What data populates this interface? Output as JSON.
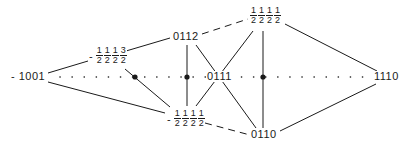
{
  "diagram": {
    "colors": {
      "ink": "#1a1a1a",
      "background": "#ffffff"
    },
    "axis": {
      "style": "dotted",
      "y": 77,
      "x_start": 40,
      "x_end": 378
    },
    "nodes": {
      "n1001": {
        "text": "- 1001",
        "x": 12,
        "y": 71
      },
      "n0112": {
        "text": "0112",
        "x": 174,
        "y": 31
      },
      "n0111": {
        "text": "0111",
        "x": 208,
        "y": 71
      },
      "n0110": {
        "text": "0110",
        "x": 252,
        "y": 129
      },
      "n1110": {
        "text": "1110",
        "x": 377,
        "y": 71
      },
      "f_neg1113": {
        "sign": "-",
        "numerators": [
          "1",
          "1",
          "1",
          "3"
        ],
        "denominators": [
          "2",
          "2",
          "2",
          "2"
        ],
        "x": 89,
        "y": 47
      },
      "f_top1111": {
        "sign": "",
        "numerators": [
          "1",
          "1",
          "1",
          "1"
        ],
        "denominators": [
          "2",
          "2",
          "2",
          "2"
        ],
        "x": 250,
        "y": 7
      },
      "f_neg1111": {
        "sign": "-",
        "numerators": [
          "1",
          "1",
          "1",
          "1"
        ],
        "denominators": [
          "2",
          "2",
          "2",
          "2"
        ],
        "x": 167,
        "y": 110
      }
    },
    "dots": [
      {
        "x": 135,
        "y": 77
      },
      {
        "x": 187,
        "y": 77
      },
      {
        "x": 263,
        "y": 77
      }
    ],
    "edges": [
      {
        "from": "n1001",
        "to": "f_neg1113",
        "style": "solid"
      },
      {
        "from": "n1001",
        "to": "f_neg1111",
        "style": "solid"
      },
      {
        "from": "f_neg1113",
        "to": "n0112",
        "style": "solid"
      },
      {
        "from": "f_neg1113",
        "to": "f_neg1111",
        "style": "solid"
      },
      {
        "from": "n0112",
        "to": "f_top1111",
        "style": "dashed"
      },
      {
        "from": "n0112",
        "to": "f_neg1111",
        "style": "solid"
      },
      {
        "from": "n0112",
        "to": "n0110",
        "style": "solid"
      },
      {
        "from": "f_top1111",
        "to": "f_neg1111",
        "style": "solid"
      },
      {
        "from": "f_top1111",
        "to": "n0110",
        "style": "solid"
      },
      {
        "from": "f_top1111",
        "to": "n1110",
        "style": "solid"
      },
      {
        "from": "f_neg1111",
        "to": "n0110",
        "style": "dashed"
      },
      {
        "from": "n0110",
        "to": "n1110",
        "style": "solid"
      }
    ]
  }
}
